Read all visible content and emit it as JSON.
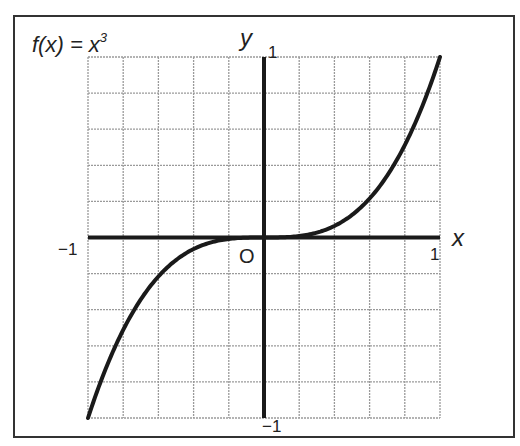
{
  "chart_data": {
    "type": "line",
    "title_parts": {
      "base": "f(x) = x",
      "exponent": "3"
    },
    "xlabel": "x",
    "ylabel": "y",
    "xlim": [
      -1,
      1
    ],
    "ylim": [
      -1,
      1
    ],
    "grid": true,
    "grid_divisions": {
      "x": 10,
      "y": 10
    },
    "origin_label": "O",
    "tick_labels": {
      "x_min": "−1",
      "x_max": "1",
      "y_min": "−1",
      "y_max": "1"
    },
    "series": [
      {
        "name": "f(x) = x^3",
        "function": "x^3",
        "x": [
          -1,
          -0.8,
          -0.6,
          -0.4,
          -0.2,
          0,
          0.2,
          0.4,
          0.6,
          0.8,
          1
        ],
        "y": [
          -1,
          -0.512,
          -0.216,
          -0.064,
          -0.008,
          0,
          0.008,
          0.064,
          0.216,
          0.512,
          1
        ]
      }
    ],
    "colors": {
      "curve": "#1a1a1a",
      "axes": "#1a1a1a",
      "grid": "#9a9a9a",
      "frame": "#333333"
    }
  }
}
